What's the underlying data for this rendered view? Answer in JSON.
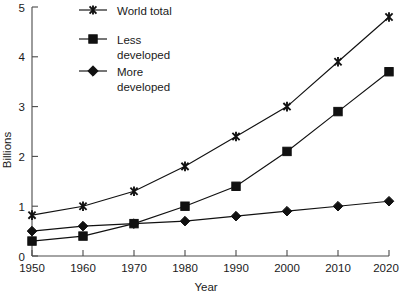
{
  "chart_data": {
    "type": "line",
    "title": "",
    "xlabel": "Year",
    "ylabel": "Billions",
    "x": [
      1950,
      1960,
      1970,
      1980,
      1990,
      2000,
      2010,
      2020
    ],
    "xticklabels": [
      "1950",
      "1960",
      "1970",
      "1980",
      "1990",
      "2000",
      "2010",
      "2020"
    ],
    "yticklabels": [
      "0",
      "1",
      "2",
      "3",
      "4",
      "5"
    ],
    "yticks": [
      0,
      1,
      2,
      3,
      4,
      5
    ],
    "xlim": [
      1950,
      2020
    ],
    "ylim": [
      0,
      5
    ],
    "grid": false,
    "legend_position": "top-left-inside",
    "series": [
      {
        "name": "World total",
        "marker": "x-star",
        "values": [
          0.82,
          1.0,
          1.3,
          1.8,
          2.4,
          3.0,
          3.9,
          4.8
        ]
      },
      {
        "name": "Less developed",
        "marker": "square",
        "values": [
          0.3,
          0.4,
          0.65,
          1.0,
          1.4,
          2.1,
          2.9,
          3.7
        ]
      },
      {
        "name": "More developed",
        "marker": "diamond",
        "values": [
          0.5,
          0.6,
          0.65,
          0.7,
          0.8,
          0.9,
          1.0,
          1.1
        ]
      }
    ],
    "colors": {
      "series": "#111111",
      "axis": "#4a4a4a",
      "background": "#ffffff"
    }
  },
  "legend": {
    "entries": [
      {
        "label": "World total",
        "line1": "World total",
        "line2": ""
      },
      {
        "label": "Less developed",
        "line1": "Less",
        "line2": "developed"
      },
      {
        "label": "More developed",
        "line1": "More",
        "line2": "developed"
      }
    ]
  },
  "axes": {
    "y_title": "Billions",
    "x_title": "Year",
    "y_labels": [
      "5",
      "4",
      "3",
      "2",
      "1",
      "0"
    ],
    "x_labels": [
      "1950",
      "1960",
      "1970",
      "1980",
      "1990",
      "2000",
      "2010",
      "2020"
    ]
  }
}
